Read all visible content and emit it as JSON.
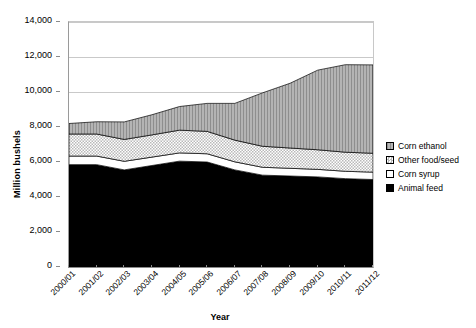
{
  "chart_data": {
    "type": "area",
    "stacked": true,
    "title": "",
    "xlabel": "Year",
    "ylabel": "Million bushels",
    "ylim": [
      0,
      14000
    ],
    "ytick_step": 2000,
    "ytick_labels": [
      "0",
      "2,000",
      "4,000",
      "6,000",
      "8,000",
      "10,000",
      "12,000",
      "14,000"
    ],
    "ytick_values": [
      0,
      2000,
      4000,
      6000,
      8000,
      10000,
      12000,
      14000
    ],
    "grid": true,
    "legend_position": "right",
    "categories": [
      "2000/01",
      "2001/02",
      "2002/03",
      "2003/04",
      "2004/05",
      "2005/06",
      "2006/07",
      "2007/08",
      "2008/09",
      "2009/10",
      "2010/11",
      "2011/12"
    ],
    "series": [
      {
        "name": "Animal feed",
        "pattern": "solid-black",
        "color": "#000000",
        "values": [
          5850,
          5850,
          5550,
          5800,
          6050,
          6000,
          5550,
          5250,
          5200,
          5150,
          5050,
          5000
        ]
      },
      {
        "name": "Corn syrup",
        "pattern": "solid-white",
        "color": "#ffffff",
        "values": [
          490,
          490,
          490,
          480,
          470,
          470,
          460,
          450,
          440,
          430,
          420,
          420
        ]
      },
      {
        "name": "Other food/seed",
        "pattern": "crosshatch-light",
        "color": "#d8d8d8",
        "values": [
          1260,
          1260,
          1250,
          1270,
          1300,
          1280,
          1240,
          1200,
          1160,
          1120,
          1090,
          1080
        ]
      },
      {
        "name": "Corn ethanol",
        "pattern": "vertical-stripe-gray",
        "color": "#a8a8a8",
        "values": [
          600,
          700,
          1000,
          1150,
          1350,
          1600,
          2100,
          3050,
          3700,
          4550,
          5000,
          5050
        ]
      }
    ],
    "series_totals": [
      8200,
      8300,
      8290,
      8700,
      9170,
      9350,
      9350,
      9950,
      10500,
      11250,
      11560,
      11550
    ]
  },
  "legend": {
    "items": [
      {
        "label": "Corn ethanol",
        "pattern": "vertical-stripe-gray"
      },
      {
        "label": "Other food/seed",
        "pattern": "crosshatch-light"
      },
      {
        "label": "Corn syrup",
        "pattern": "solid-white"
      },
      {
        "label": "Animal feed",
        "pattern": "solid-black"
      }
    ]
  }
}
